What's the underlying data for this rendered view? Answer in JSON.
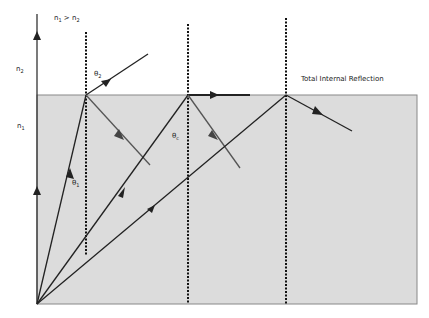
{
  "diagram": {
    "title": "Total Internal Reflection",
    "condition_label": "n",
    "condition_sub1": "1",
    "condition_op": " > n",
    "condition_sub2": "2",
    "medium_top": {
      "label": "n",
      "sub": "2"
    },
    "medium_bottom": {
      "label": "n",
      "sub": "1"
    },
    "angles": {
      "theta1": {
        "label": "θ",
        "sub": "1"
      },
      "theta2": {
        "label": "θ",
        "sub": "2"
      },
      "thetac": {
        "label": "θ",
        "sub": "c"
      }
    },
    "colors": {
      "medium_fill": "#dcdcdc",
      "boundary": "#777777",
      "ray": "#222222",
      "reflected_ray": "#444444",
      "normal": "#111111"
    }
  }
}
